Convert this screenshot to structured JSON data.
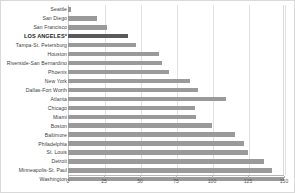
{
  "chart_data": {
    "type": "bar",
    "orientation": "horizontal",
    "title": "",
    "xlabel": "",
    "ylabel": "",
    "xlim": [
      0,
      150
    ],
    "grid": true,
    "legend": null,
    "highlight_category": "LOS ANGELES*",
    "colors": {
      "bar": "#9a9a9a",
      "bar_highlight": "#5a5a5a",
      "gridline": "#e2e2e2",
      "axis": "#b4b4b4",
      "background": "#ffffff"
    },
    "xticks": [
      0,
      25,
      50,
      75,
      100,
      125,
      150
    ],
    "categories": [
      "Seattle",
      "San Diego",
      "San Francisco",
      "LOS ANGELES*",
      "Tampa-St. Petersburg",
      "Houston",
      "Riverside-San Bernardino",
      "Phoenix",
      "New York",
      "Dallas-Fort Worth",
      "Atlanta",
      "Chicago",
      "Miami",
      "Boston",
      "Baltimore",
      "Philadelphia",
      "St. Louis",
      "Detroit",
      "Minneapolis-St. Paul",
      "Washington"
    ],
    "values": [
      2,
      20,
      27,
      42,
      47,
      63,
      65,
      70,
      85,
      90,
      110,
      88,
      89,
      100,
      116,
      122,
      125,
      136,
      142,
      150
    ]
  }
}
